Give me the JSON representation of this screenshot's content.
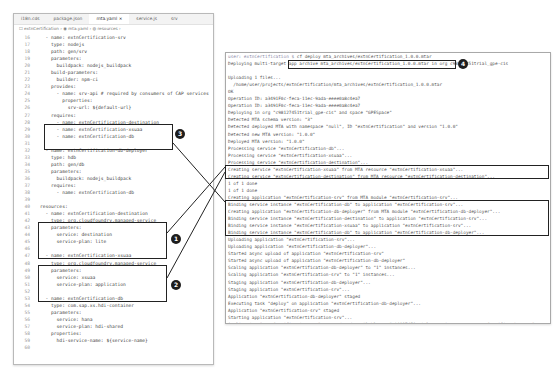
{
  "editor": {
    "tabs": [
      {
        "label": "i18n.cds",
        "active": false
      },
      {
        "label": "package.json",
        "active": false
      },
      {
        "label": "mta.yaml ×",
        "active": true
      },
      {
        "label": "service.js",
        "active": false
      },
      {
        "label": "srv",
        "active": false
      }
    ],
    "breadcrumb": "☐ extnCertification  ›  ◉ mta.yaml  ›  ◍ resources  ›",
    "lines": [
      {
        "n": "16",
        "text": "  - name: extnCertification-srv"
      },
      {
        "n": "17",
        "text": "    type: nodejs"
      },
      {
        "n": "18",
        "text": "    path: gen/srv"
      },
      {
        "n": "19",
        "text": "    parameters:"
      },
      {
        "n": "20",
        "text": "      buildpack: nodejs_buildpack"
      },
      {
        "n": "21",
        "text": "    build-parameters:"
      },
      {
        "n": "22",
        "text": "      builder: npm-ci"
      },
      {
        "n": "23",
        "text": "    provides:"
      },
      {
        "n": "24",
        "text": "      - name: srv-api # required by consumers of CAP services"
      },
      {
        "n": "25",
        "text": "        properties:"
      },
      {
        "n": "26",
        "text": "          srv-url: ${default-url}"
      },
      {
        "n": "27",
        "text": "    requires:"
      },
      {
        "n": "28",
        "text": "      - name: extnCertification-destination"
      },
      {
        "n": "29",
        "text": "      - name: extnCertification-xsuaa"
      },
      {
        "n": "30",
        "text": "      - name: extnCertification-db"
      },
      {
        "n": "31",
        "text": ""
      },
      {
        "n": "32",
        "text": "  - name: extnCertification-db-deployer"
      },
      {
        "n": "33",
        "text": "    type: hdb"
      },
      {
        "n": "34",
        "text": "    path: gen/db"
      },
      {
        "n": "35",
        "text": "    parameters:"
      },
      {
        "n": "36",
        "text": "      buildpack: nodejs_buildpack"
      },
      {
        "n": "37",
        "text": "    requires:"
      },
      {
        "n": "38",
        "text": "      - name: extnCertification-db"
      },
      {
        "n": "39",
        "text": ""
      },
      {
        "n": "40",
        "text": "resources:"
      },
      {
        "n": "41",
        "text": "  - name: extnCertification-destination"
      },
      {
        "n": "42",
        "text": "    type: org.cloudfoundry.managed-service"
      },
      {
        "n": "43",
        "text": "    parameters:"
      },
      {
        "n": "44",
        "text": "      service: destination"
      },
      {
        "n": "45",
        "text": "      service-plan: lite"
      },
      {
        "n": "46",
        "text": ""
      },
      {
        "n": "47",
        "text": "  - name: extnCertification-xsuaa"
      },
      {
        "n": "48",
        "text": "    type: org.cloudfoundry.managed-service"
      },
      {
        "n": "49",
        "text": "    parameters:"
      },
      {
        "n": "50",
        "text": "      service: xsuaa"
      },
      {
        "n": "51",
        "text": "      service-plan: application"
      },
      {
        "n": "52",
        "text": ""
      },
      {
        "n": "53",
        "text": "  - name: extnCertification-db"
      },
      {
        "n": "54",
        "text": "    type: com.sap.xs.hdi-container"
      },
      {
        "n": "55",
        "text": "    parameters:"
      },
      {
        "n": "56",
        "text": "      service: hana"
      },
      {
        "n": "57",
        "text": "      service-plan: hdi-shared"
      },
      {
        "n": "58",
        "text": "    properties:"
      },
      {
        "n": "59",
        "text": "      hdi-service-name: ${service-name}"
      },
      {
        "n": "60",
        "text": ""
      }
    ]
  },
  "terminal": {
    "prompt": "user: extnCertification $ ",
    "command": "cf deploy mta_archives/extnCertification_1.0.0.mtar",
    "lines": [
      "Deploying multi-target app archive mta_archives/extnCertification_1.0.0.mtar in org c98127451trial_gpe-cis",
      "",
      "Uploading 1 files...",
      "  /home/user/projects/extnCertification/mta_archives/extnCertification_1.0.0.mtar",
      "OK",
      "Operation ID: a3491F0c-feca-11ec-9ada-eeee0a8c4ea7",
      "Operation ID: a3491F0c-feca-11ec-9ada-eeee0a8c4ea7",
      "Deploying in org \"c98127451trial_gpe-cis\" and space \"GPESpace\"",
      "Detected MTA schema version: \"3\"",
      "Detected deployed MTA with namespace \"null\", ID \"extnCertification\" and version \"1.0.0\"",
      "Detected new MTA version: \"1.0.0\"",
      "Deployed MTA version: \"1.0.0\"",
      "Processing service \"extnCertification-db\"...",
      "Processing service \"extnCertification-xsuaa\"...",
      "Processing service \"extnCertification-destination\"...",
      "Creating service \"extnCertification-xsuaa\" from MTA resource \"extnCertification-xsuaa\"...",
      "Creating service \"extnCertification-destination\" from MTA resource \"extnCertification-destination\"...",
      "1 of 1 done",
      "1 of 1 done",
      "Creating application \"extnCertification-srv\" from MTA module \"extnCertification-srv\"...",
      "Binding service instance \"extnCertification-db\" to application \"extnCertification-srv\"...",
      "Creating application \"extnCertification-db-deployer\" from MTA module \"extnCertification-db-deployer\"...",
      "Binding service instance \"extnCertification-destination\" to application \"extnCertification-srv\"...",
      "Binding service instance \"extnCertification-xsuaa\" to application \"extnCertification-srv\"...",
      "Binding service instance \"extnCertification-db\" to application \"extnCertification-db-deployer\"...",
      "Uploading application \"extnCertification-srv\"...",
      "Uploading application \"extnCertification-db-deployer\"...",
      "Started async upload of application \"extnCertification-srv\"",
      "Started async upload of application \"extnCertification-db-deployer\"",
      "Scaling application \"extnCertification-db-deployer\" to \"1\" instances...",
      "Scaling application \"extnCertification-srv\" to \"1\" instances...",
      "Staging application \"extnCertification-db-deployer\"...",
      "Staging application \"extnCertification-srv\"...",
      "Application \"extnCertification-db-deployer\" staged",
      "Executing task \"deploy\" on application \"extnCertification-db-deployer\"...",
      "Application \"extnCertification-srv\" staged",
      "Starting application \"extnCertification-srv\"...",
      "Application \"extnCertification-srv\" started and available at \"c98127451trial-gpe-cis-gpespace-extnCertification-srv\"",
      "Skipping deletion of services, because the command line option \"--delete-services\" is not specified.",
      "Process finished.",
      "Use \"cf dmol -i a3491F0c-feca-11ec-9ada-eeee0a8c4ea7\" to download the logs of the process."
    ],
    "final_prompt": "user: extnCertification $ "
  },
  "callouts": [
    {
      "id": "callout-1",
      "label": "1"
    },
    {
      "id": "callout-2",
      "label": "2"
    },
    {
      "id": "callout-3",
      "label": "3"
    },
    {
      "id": "callout-4",
      "label": "4"
    }
  ],
  "colors": {
    "highlight_border": "#222222",
    "badge_bg": "#1d1d1d",
    "line_number": "#9a9a9a",
    "code_text": "#444444"
  }
}
